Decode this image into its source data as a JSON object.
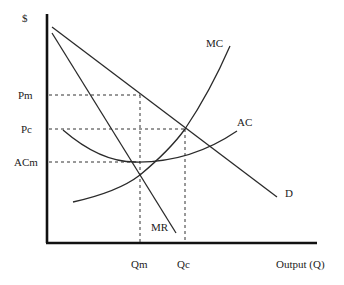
{
  "diagram": {
    "y_axis_label": "$",
    "x_axis_label": "Output (Q)",
    "y_ticks": [
      {
        "label": "Pm",
        "y": 95
      },
      {
        "label": "Pc",
        "y": 129
      },
      {
        "label": "ACm",
        "y": 162
      }
    ],
    "x_ticks": [
      {
        "label": "Qm",
        "x": 140
      },
      {
        "label": "Qc",
        "x": 185
      }
    ],
    "curves": [
      {
        "name": "D",
        "label": "D"
      },
      {
        "name": "MR",
        "label": "MR"
      },
      {
        "name": "MC",
        "label": "MC"
      },
      {
        "name": "AC",
        "label": "AC"
      }
    ],
    "colors": {
      "line": "#2a2a2a",
      "axis": "#111111",
      "text": "#222222"
    }
  }
}
